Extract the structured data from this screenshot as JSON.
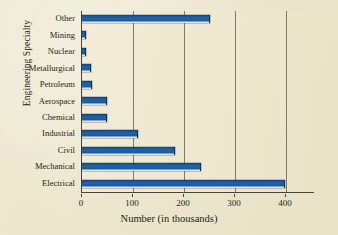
{
  "chart_data": {
    "type": "bar",
    "orientation": "horizontal",
    "title": "",
    "xlabel": "Number (in thousands)",
    "ylabel": "Engineering Specialty",
    "categories": [
      "Other",
      "Mining",
      "Nuclear",
      "Metallurgical",
      "Petroleum",
      "Aerospace",
      "Chemical",
      "Industrial",
      "Civil",
      "Mechanical",
      "Electrical"
    ],
    "values": [
      250,
      5,
      5,
      15,
      18,
      48,
      48,
      107,
      180,
      232,
      396
    ],
    "xlim": [
      0,
      455
    ],
    "xticks": [
      0,
      100,
      200,
      300,
      400
    ],
    "xtick_labels": [
      "0",
      "100",
      "200",
      "300",
      "400"
    ],
    "grid": "vertical",
    "legend": "none",
    "bar_color": "#1E63AC",
    "background_color": "#EEE8CF",
    "axis_color": "#4A4436"
  },
  "axes": {
    "y_title": "Engineering Specialty",
    "x_title": "Number (in thousands)"
  }
}
